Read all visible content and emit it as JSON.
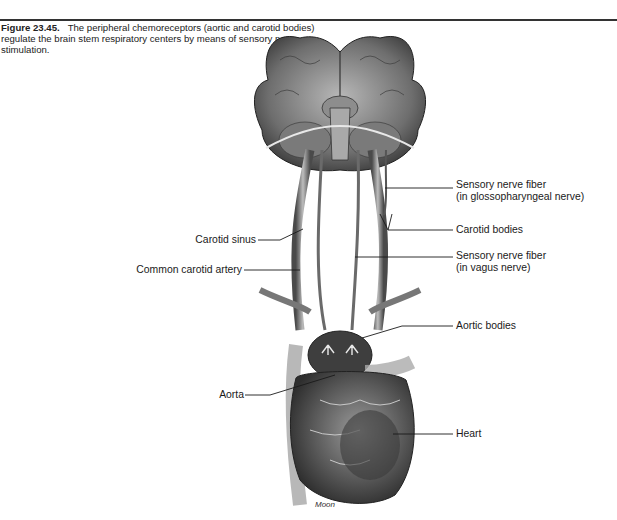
{
  "figure": {
    "number": "Figure 23.45.",
    "caption": "The peripheral chemoreceptors (aortic and carotid bodies) regulate the brain stem respiratory centers by means of sensory nerve stimulation."
  },
  "labels": {
    "sensory_glosso_line1": "Sensory nerve fiber",
    "sensory_glosso_line2": "(in glossopharyngeal nerve)",
    "carotid_bodies": "Carotid bodies",
    "sensory_vagus_line1": "Sensory nerve fiber",
    "sensory_vagus_line2": "(in vagus nerve)",
    "aortic_bodies": "Aortic bodies",
    "heart": "Heart",
    "carotid_sinus": "Carotid sinus",
    "common_carotid_artery": "Common carotid artery",
    "aorta": "Aorta"
  },
  "credit": "Moon"
}
